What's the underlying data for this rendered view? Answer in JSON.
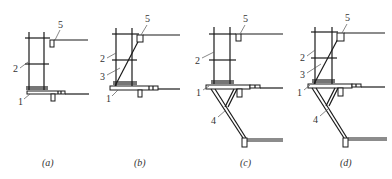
{
  "figure": {
    "panels": [
      {
        "id": "a",
        "caption": "(a)",
        "labels": [
          "1",
          "2",
          "5"
        ]
      },
      {
        "id": "b",
        "caption": "(b)",
        "labels": [
          "1",
          "2",
          "3",
          "5"
        ]
      },
      {
        "id": "c",
        "caption": "(c)",
        "labels": [
          "1",
          "2",
          "4",
          "5"
        ]
      },
      {
        "id": "d",
        "caption": "(d)",
        "labels": [
          "1",
          "2",
          "3",
          "4",
          "5"
        ]
      }
    ],
    "part_numbers": [
      "1",
      "2",
      "3",
      "4",
      "5"
    ],
    "colors": {
      "line": "#1a1a1a",
      "leader": "#555555",
      "text": "#333333",
      "background": "#ffffff"
    }
  }
}
